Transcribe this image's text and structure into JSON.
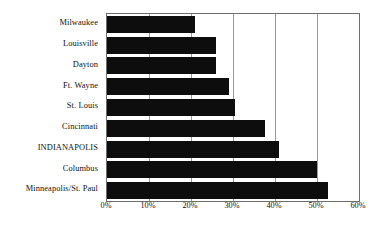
{
  "chart_data": {
    "type": "bar",
    "orientation": "horizontal",
    "title": "",
    "subtitle": "",
    "xlabel": "",
    "ylabel": "",
    "categories": [
      "Milwaukee",
      "Louisville",
      "Dayton",
      "Ft. Wayne",
      "St. Louis",
      "Cincinnati",
      "INDIANAPOLIS",
      "Columbus",
      "Minneapolis/St. Paul"
    ],
    "values": [
      21,
      26,
      26,
      29,
      30.5,
      37.5,
      41,
      50,
      52.5
    ],
    "value_format": "percent",
    "xlim": [
      0,
      60
    ],
    "tick_labels": [
      "0%",
      "10%",
      "20%",
      "30%",
      "40%",
      "50%",
      "60%"
    ],
    "tick_values": [
      0,
      10,
      20,
      30,
      40,
      50,
      60
    ],
    "grid": true,
    "grid_axis": "x",
    "legend": "none",
    "bar_color": "#0d0d0d",
    "gridline_color": "#9a9a9a",
    "frame_color": "#6e6e6e",
    "background_color": "#ffffff",
    "highlighted_category": "INDIANAPOLIS"
  }
}
